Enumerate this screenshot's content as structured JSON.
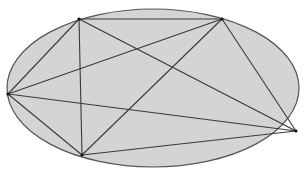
{
  "diagram": {
    "type": "complete-graph-in-ellipse",
    "ellipse": {
      "cx": 153,
      "cy": 88,
      "rx": 146,
      "ry": 79,
      "fill": "#d4d4d4",
      "stroke": "#555555"
    },
    "vertices": [
      {
        "id": "A",
        "x": 79,
        "y": 19
      },
      {
        "id": "B",
        "x": 222,
        "y": 19
      },
      {
        "id": "C",
        "x": 8,
        "y": 94
      },
      {
        "id": "D",
        "x": 296,
        "y": 131
      },
      {
        "id": "E",
        "x": 82,
        "y": 155
      }
    ],
    "edges": [
      [
        "A",
        "B"
      ],
      [
        "A",
        "C"
      ],
      [
        "A",
        "D"
      ],
      [
        "A",
        "E"
      ],
      [
        "B",
        "C"
      ],
      [
        "B",
        "D"
      ],
      [
        "B",
        "E"
      ],
      [
        "C",
        "D"
      ],
      [
        "C",
        "E"
      ],
      [
        "D",
        "E"
      ]
    ],
    "edge_color": "#3a3a3a"
  }
}
